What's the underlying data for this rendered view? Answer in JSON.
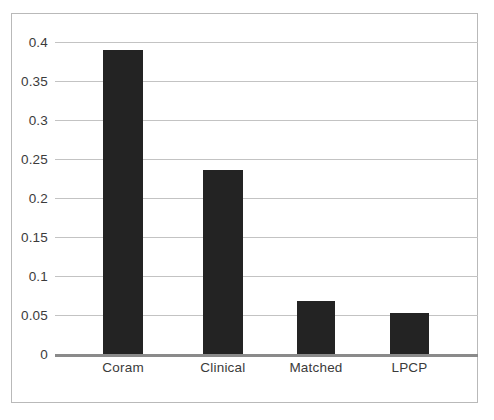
{
  "chart_data": {
    "type": "bar",
    "title": "",
    "subtitle": "",
    "xlabel": "",
    "ylabel": "",
    "categories": [
      "Coram",
      "Clinical",
      "Matched",
      "LPCP"
    ],
    "values": [
      0.39,
      0.236,
      0.068,
      0.053
    ],
    "series": [
      {
        "name": "",
        "values": [
          0.39,
          0.236,
          0.068,
          0.053
        ]
      }
    ],
    "ylim": [
      0,
      0.4
    ],
    "xlim": [
      0,
      4
    ],
    "yticks": [
      0,
      0.05,
      0.1,
      0.15,
      0.2,
      0.25,
      0.3,
      0.35,
      0.4
    ],
    "ytick_labels": [
      "0",
      "0.05",
      "0.1",
      "0.15",
      "0.2",
      "0.25",
      "0.3",
      "0.35",
      "0.4"
    ],
    "grid": true,
    "grid_axis": "y",
    "legend": false,
    "legend_position": "none",
    "annotations": [],
    "colors": {
      "bar": "#232323",
      "gridline": "#c3c3c3",
      "baseline": "#8a8a8a",
      "text": "#3b3b3b",
      "border": "#b9b9b9",
      "background": "#ffffff"
    },
    "bar_geometry": [
      {
        "category": "Coram",
        "center_pct": 16.1,
        "width_pct": 9.5
      },
      {
        "category": "Clinical",
        "center_pct": 39.7,
        "width_pct": 9.5
      },
      {
        "category": "Matched",
        "center_pct": 61.7,
        "width_pct": 9.0
      },
      {
        "category": "LPCP",
        "center_pct": 83.8,
        "width_pct": 9.2
      }
    ]
  }
}
